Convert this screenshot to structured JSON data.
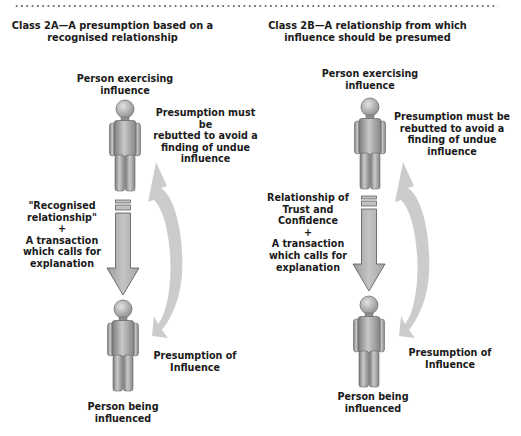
{
  "separator": "dotted-line",
  "panels": [
    {
      "id": "class-2a",
      "title": "Class 2A—A presumption based on a\nrecognised relationship",
      "top_person_label": "Person exercising\ninfluence",
      "rebuttal_label": "Presumption must be\nrebutted to avoid a\nfinding of   undue\ninfluence",
      "relationship_label": "\"Recognised\nrelationship\"\n+\nA transaction\nwhich calls for\nexplanation",
      "presumption_label": "Presumption of\nInfluence",
      "bottom_person_label": "Person being\ninfluenced"
    },
    {
      "id": "class-2b",
      "title": "Class 2B—A relationship from which\ninfluence should be presumed",
      "top_person_label": "Person exercising\ninfluence",
      "rebuttal_label": "Presumption must be\nrebutted to avoid a\nfinding of  undue\ninfluence",
      "relationship_label": "Relationship of\nTrust and\nConfidence\n+\nA transaction\nwhich calls for\nexplanation",
      "presumption_label": "Presumption of\nInfluence",
      "bottom_person_label": "Person being\ninfluenced"
    }
  ],
  "icons": {
    "person": "person-figure-icon",
    "down_arrow": "down-arrow-icon",
    "curved_arrow": "curved-double-arrow-icon"
  },
  "colors": {
    "figure_gray": "#9a9a9a",
    "figure_outline": "#555555",
    "curved_arrow_gray": "#c8c8c8",
    "down_arrow_fill": "#b5b5b5",
    "text": "#1a1a1a"
  }
}
